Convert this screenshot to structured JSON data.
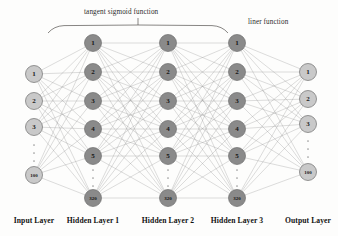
{
  "diagram": {
    "title_top": "tangent sigmoid function",
    "title_right": "liner function",
    "background": "#fdfdfc",
    "edge_color": "#8d8d8d",
    "node_io_color": "#c9c9c9",
    "node_hidden_color": "#8a8a8a"
  },
  "layers": [
    {
      "id": "input",
      "caption": "Input Layer",
      "kind": "io",
      "x": 34,
      "node_radius": 8.5,
      "nodes": [
        {
          "label": "1",
          "y": 74
        },
        {
          "label": "2",
          "y": 101
        },
        {
          "label": "3",
          "y": 127
        },
        {
          "label": "100",
          "y": 175
        }
      ],
      "ellipsis": {
        "x": 34,
        "y_start": 145,
        "y_end": 161,
        "count": 3
      }
    },
    {
      "id": "hidden1",
      "caption": "Hidden Layer 1",
      "kind": "hidden",
      "x": 93,
      "node_radius": 8.5,
      "nodes": [
        {
          "label": "1",
          "y": 43
        },
        {
          "label": "2",
          "y": 72
        },
        {
          "label": "3",
          "y": 101
        },
        {
          "label": "4",
          "y": 129
        },
        {
          "label": "5",
          "y": 156
        },
        {
          "label": "320",
          "y": 198
        }
      ],
      "ellipsis": {
        "x": 93,
        "y_start": 170,
        "y_end": 186,
        "count": 3
      }
    },
    {
      "id": "hidden2",
      "caption": "Hidden Layer 2",
      "kind": "hidden",
      "x": 168,
      "node_radius": 8.5,
      "nodes": [
        {
          "label": "1",
          "y": 43
        },
        {
          "label": "2",
          "y": 72
        },
        {
          "label": "3",
          "y": 101
        },
        {
          "label": "4",
          "y": 129
        },
        {
          "label": "5",
          "y": 156
        },
        {
          "label": "320",
          "y": 198
        }
      ],
      "ellipsis": {
        "x": 168,
        "y_start": 170,
        "y_end": 186,
        "count": 3
      }
    },
    {
      "id": "hidden3",
      "caption": "Hidden Layer 3",
      "kind": "hidden",
      "x": 237,
      "node_radius": 8.5,
      "nodes": [
        {
          "label": "1",
          "y": 43
        },
        {
          "label": "2",
          "y": 72
        },
        {
          "label": "3",
          "y": 101
        },
        {
          "label": "4",
          "y": 129
        },
        {
          "label": "5",
          "y": 156
        },
        {
          "label": "320",
          "y": 198
        }
      ],
      "ellipsis": {
        "x": 237,
        "y_start": 170,
        "y_end": 186,
        "count": 3
      }
    },
    {
      "id": "output",
      "caption": "Output Layer",
      "kind": "io",
      "x": 308,
      "node_radius": 8.5,
      "nodes": [
        {
          "label": "1",
          "y": 72
        },
        {
          "label": "2",
          "y": 99
        },
        {
          "label": "3",
          "y": 124
        },
        {
          "label": "100",
          "y": 172
        }
      ],
      "ellipsis": {
        "x": 308,
        "y_start": 141,
        "y_end": 157,
        "count": 3
      }
    }
  ],
  "caption_positions": [
    {
      "id": "input",
      "x": 34
    },
    {
      "id": "hidden1",
      "x": 93
    },
    {
      "id": "hidden2",
      "x": 168
    },
    {
      "id": "hidden3",
      "x": 237
    },
    {
      "id": "output",
      "x": 308
    }
  ],
  "brace": {
    "left_x": 48,
    "right_x": 228,
    "baseline_y": 33,
    "tip_y": 25,
    "center_x": 138,
    "tick_top_y": 18
  }
}
